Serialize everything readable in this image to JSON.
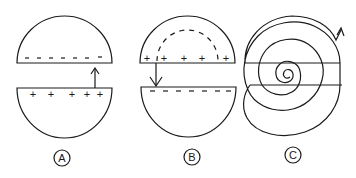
{
  "figure": {
    "panels": [
      {
        "id": "A",
        "label": "A",
        "top_half": {
          "charge": "negative",
          "signs": [
            "–",
            "–",
            "–",
            "–",
            "–",
            "–",
            "–"
          ]
        },
        "bottom_half": {
          "charge": "positive",
          "signs": [
            "+",
            "+",
            "+",
            "+",
            "+"
          ]
        },
        "arrow": "up"
      },
      {
        "id": "B",
        "label": "B",
        "top_half": {
          "charge": "positive",
          "signs": [
            "+",
            "+",
            "+",
            "+",
            "+",
            "+"
          ],
          "inner_dashed_arc": true
        },
        "bottom_half": {
          "charge": "negative",
          "signs": [
            "–",
            "–",
            "–",
            "–",
            "–",
            "–",
            "–"
          ]
        },
        "arrow": "down"
      },
      {
        "id": "C",
        "label": "C",
        "description": "spiral path through both halves",
        "arrow": "up-right exit"
      }
    ]
  }
}
